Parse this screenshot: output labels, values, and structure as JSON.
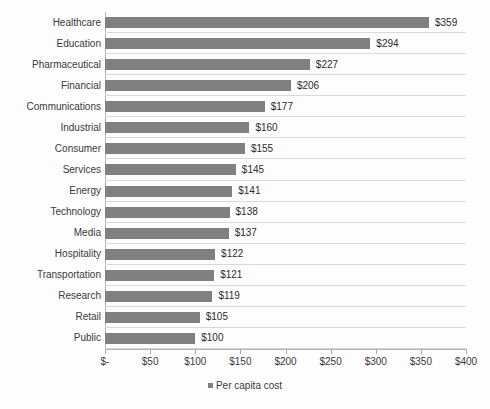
{
  "chart_data": {
    "type": "bar",
    "orientation": "horizontal",
    "title": "",
    "subtitle": "",
    "xlabel": "",
    "ylabel": "",
    "categories": [
      "Healthcare",
      "Education",
      "Pharmaceutical",
      "Financial",
      "Communications",
      "Industrial",
      "Consumer",
      "Services",
      "Energy",
      "Technology",
      "Media",
      "Hospitality",
      "Transportation",
      "Research",
      "Retail",
      "Public"
    ],
    "values": [
      359,
      294,
      227,
      206,
      177,
      160,
      155,
      145,
      141,
      138,
      137,
      122,
      121,
      119,
      105,
      100
    ],
    "data_labels": [
      "$359",
      "$294",
      "$227",
      "$206",
      "$177",
      "$160",
      "$155",
      "$145",
      "$141",
      "$138",
      "$137",
      "$122",
      "$121",
      "$119",
      "$105",
      "$100"
    ],
    "series": [
      {
        "name": "Per capita cost",
        "color": "#808080",
        "values": [
          359,
          294,
          227,
          206,
          177,
          160,
          155,
          145,
          141,
          138,
          137,
          122,
          121,
          119,
          105,
          100
        ]
      }
    ],
    "xlim": [
      0,
      400
    ],
    "x_ticks": [
      0,
      50,
      100,
      150,
      200,
      250,
      300,
      350,
      400
    ],
    "x_tick_labels": [
      "$-",
      "$50",
      "$100",
      "$150",
      "$200",
      "$250",
      "$300",
      "$350",
      "$400"
    ],
    "grid": "horizontal-row-separators",
    "legend": {
      "position": "bottom-center",
      "entries": [
        {
          "label": "Per capita cost",
          "color": "#808080",
          "marker": "square"
        }
      ]
    },
    "colors": {
      "bar": "#808080",
      "background": "#fdfdfd",
      "gridline": "#d9d9d9",
      "axis": "#b0b0b0",
      "text": "#3a3a3a"
    }
  }
}
